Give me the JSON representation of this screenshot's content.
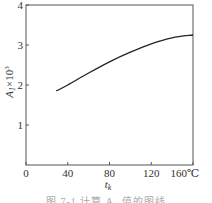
{
  "chart_data": {
    "type": "line",
    "title": "",
    "xlabel": "t_k",
    "x_unit": "℃",
    "ylabel": "A₁×10³",
    "xlim": [
      0,
      160
    ],
    "ylim": [
      0,
      4
    ],
    "xticks": [
      0,
      40,
      80,
      120,
      160
    ],
    "xtick_labels": [
      "0",
      "40",
      "80",
      "120",
      "160℃"
    ],
    "yticks": [
      1,
      2,
      3,
      4
    ],
    "ytick_labels": [
      "1",
      "2",
      "3",
      "4"
    ],
    "grid": false,
    "legend": null,
    "series": [
      {
        "name": "A1",
        "x": [
          29,
          40,
          60,
          80,
          100,
          120,
          140,
          160
        ],
        "values": [
          1.85,
          2.0,
          2.3,
          2.58,
          2.82,
          3.03,
          3.18,
          3.25
        ]
      }
    ]
  },
  "caption": "图 7-1  计算 A₁ 值的图线",
  "labels": {
    "x_title_main": "t",
    "x_title_sub": "k",
    "y_title_main": "A",
    "y_title_sub": "1",
    "y_title_rest": "×10",
    "y_title_sup": "3"
  }
}
